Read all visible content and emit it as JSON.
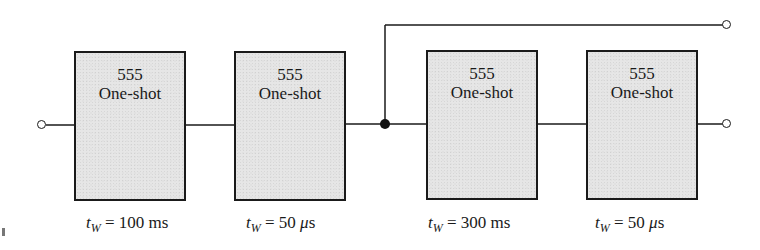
{
  "diagram": {
    "type": "block-diagram",
    "colors": {
      "line": "#1a1a1a",
      "block_fill": "#e6e6e6",
      "background": "#ffffff"
    },
    "blocks": [
      {
        "chip": "555",
        "kind": "One-shot",
        "tw_symbol": "t",
        "tw_subscript": "W",
        "tw_value": "= 100 ms"
      },
      {
        "chip": "555",
        "kind": "One-shot",
        "tw_symbol": "t",
        "tw_subscript": "W",
        "tw_value_prefix": "= 50 ",
        "tw_mu": "μ",
        "tw_unit": "s"
      },
      {
        "chip": "555",
        "kind": "One-shot",
        "tw_symbol": "t",
        "tw_subscript": "W",
        "tw_value": "= 300 ms"
      },
      {
        "chip": "555",
        "kind": "One-shot",
        "tw_symbol": "t",
        "tw_subscript": "W",
        "tw_value_prefix": "= 50 ",
        "tw_mu": "μ",
        "tw_unit": "s"
      }
    ],
    "terminals": {
      "input": "open-circle",
      "output_top": "open-circle",
      "output_bottom": "open-circle",
      "junction": "filled-dot"
    },
    "connections": [
      "input -> block1",
      "block1 -> block2",
      "block2 -> junction",
      "junction -> block3",
      "junction -> output_top",
      "block3 -> block4",
      "block4 -> output_bottom"
    ]
  }
}
